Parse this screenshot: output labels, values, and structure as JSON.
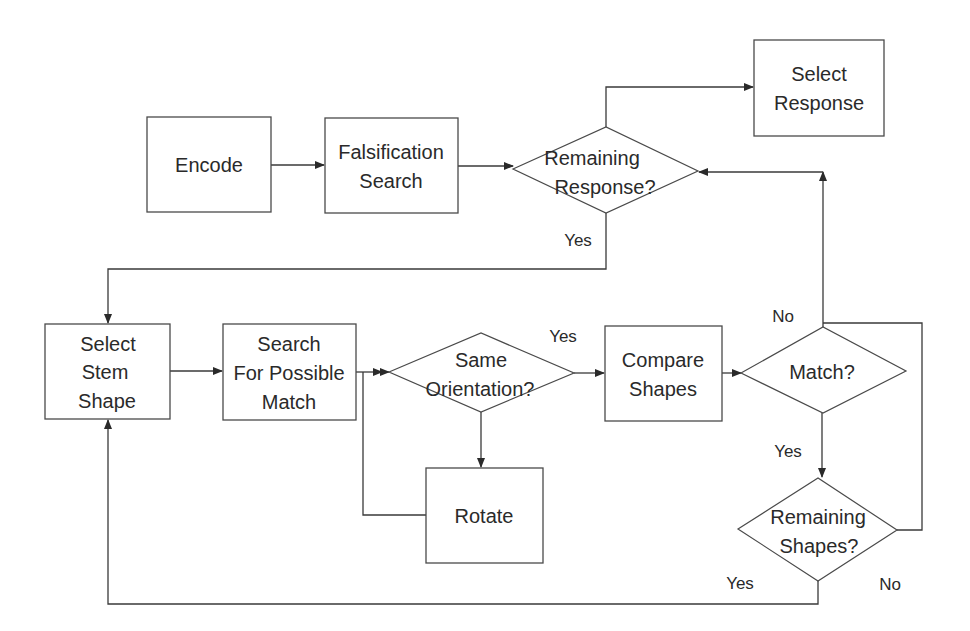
{
  "diagram": {
    "type": "flowchart",
    "nodes": {
      "encode": {
        "shape": "process",
        "lines": [
          "Encode"
        ]
      },
      "falsification_search": {
        "shape": "process",
        "lines": [
          "Falsification",
          "Search"
        ]
      },
      "remaining_response": {
        "shape": "decision",
        "lines": [
          "Remaining",
          "Response?"
        ]
      },
      "select_response": {
        "shape": "process",
        "lines": [
          "Select",
          "Response"
        ]
      },
      "select_stem_shape": {
        "shape": "process",
        "lines": [
          "Select",
          "Stem",
          "Shape"
        ]
      },
      "search_possible_match": {
        "shape": "process",
        "lines": [
          "Search",
          "For Possible",
          "Match"
        ]
      },
      "same_orientation": {
        "shape": "decision",
        "lines": [
          "Same",
          "Orientation?"
        ]
      },
      "rotate": {
        "shape": "process",
        "lines": [
          "Rotate"
        ]
      },
      "compare_shapes": {
        "shape": "process",
        "lines": [
          "Compare",
          "Shapes"
        ]
      },
      "match": {
        "shape": "decision",
        "lines": [
          "Match?"
        ]
      },
      "remaining_shapes": {
        "shape": "decision",
        "lines": [
          "Remaining",
          "Shapes?"
        ]
      }
    },
    "edges": [
      {
        "from": "encode",
        "to": "falsification_search",
        "label": ""
      },
      {
        "from": "falsification_search",
        "to": "remaining_response",
        "label": ""
      },
      {
        "from": "remaining_response",
        "to": "select_response",
        "label": ""
      },
      {
        "from": "remaining_response",
        "to": "select_stem_shape",
        "label": "Yes"
      },
      {
        "from": "select_stem_shape",
        "to": "search_possible_match",
        "label": ""
      },
      {
        "from": "search_possible_match",
        "to": "same_orientation",
        "label": ""
      },
      {
        "from": "same_orientation",
        "to": "compare_shapes",
        "label": "Yes"
      },
      {
        "from": "same_orientation",
        "to": "rotate",
        "label": ""
      },
      {
        "from": "rotate",
        "to": "same_orientation",
        "label": ""
      },
      {
        "from": "compare_shapes",
        "to": "match",
        "label": ""
      },
      {
        "from": "match",
        "to": "remaining_response",
        "label": "No"
      },
      {
        "from": "match",
        "to": "remaining_shapes",
        "label": "Yes"
      },
      {
        "from": "remaining_shapes",
        "to": "select_stem_shape",
        "label": "Yes"
      },
      {
        "from": "remaining_shapes",
        "to": "match",
        "label": "No"
      }
    ],
    "edge_labels": {
      "remaining_response_yes": "Yes",
      "same_orientation_yes": "Yes",
      "match_no": "No",
      "match_yes": "Yes",
      "remaining_shapes_yes": "Yes",
      "remaining_shapes_no": "No"
    }
  }
}
